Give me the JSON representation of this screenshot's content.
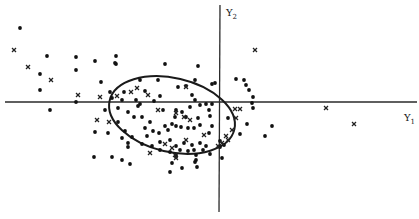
{
  "chart_data": {
    "type": "scatter",
    "title": "",
    "xlabel": "Y1",
    "ylabel": "Y2",
    "axes": {
      "origin_px": [
        220,
        102
      ],
      "x_axis_px": [
        5,
        417
      ],
      "y_axis_px": [
        5,
        212
      ],
      "ticks": "none",
      "grid": false
    },
    "ellipse": {
      "cx": 172,
      "cy": 115,
      "rx": 64,
      "ry": 37,
      "rotate_deg": 13,
      "description": "concentration ellipse around the main cluster"
    },
    "legend": null,
    "series": [
      {
        "name": "dots",
        "marker": "dot",
        "points": [
          [
            20,
            28
          ],
          [
            47,
            56
          ],
          [
            40,
            74
          ],
          [
            76,
            57
          ],
          [
            76,
            70
          ],
          [
            95,
            61
          ],
          [
            116,
            56
          ],
          [
            116,
            64
          ],
          [
            101,
            82
          ],
          [
            40,
            90
          ],
          [
            76,
            102
          ],
          [
            105,
            110
          ],
          [
            95,
            132
          ],
          [
            108,
            133
          ],
          [
            122,
            138
          ],
          [
            128,
            147
          ],
          [
            94,
            157
          ],
          [
            112,
            157
          ],
          [
            115,
            63
          ],
          [
            140,
            80
          ],
          [
            158,
            80
          ],
          [
            160,
            96
          ],
          [
            145,
            91
          ],
          [
            124,
            92
          ],
          [
            110,
            92
          ],
          [
            112,
            98
          ],
          [
            122,
            100
          ],
          [
            136,
            100
          ],
          [
            140,
            104
          ],
          [
            165,
            64
          ],
          [
            198,
            66
          ],
          [
            195,
            80
          ],
          [
            192,
            95
          ],
          [
            195,
            100
          ],
          [
            178,
            87
          ],
          [
            186,
            86
          ],
          [
            154,
            101
          ],
          [
            163,
            110
          ],
          [
            176,
            110
          ],
          [
            138,
            106
          ],
          [
            118,
            108
          ],
          [
            128,
            112
          ],
          [
            118,
            122
          ],
          [
            134,
            117
          ],
          [
            125,
            131
          ],
          [
            132,
            137
          ],
          [
            128,
            143
          ],
          [
            142,
            117
          ],
          [
            150,
            122
          ],
          [
            145,
            128
          ],
          [
            147,
            136
          ],
          [
            153,
            131
          ],
          [
            159,
            133
          ],
          [
            165,
            126
          ],
          [
            172,
            124
          ],
          [
            168,
            130
          ],
          [
            176,
            126
          ],
          [
            181,
            127
          ],
          [
            188,
            128
          ],
          [
            194,
            128
          ],
          [
            200,
            125
          ],
          [
            198,
            118
          ],
          [
            186,
            117
          ],
          [
            175,
            117
          ],
          [
            182,
            112
          ],
          [
            190,
            107
          ],
          [
            200,
            105
          ],
          [
            206,
            104
          ],
          [
            212,
            104
          ],
          [
            209,
            110
          ],
          [
            210,
            116
          ],
          [
            212,
            126
          ],
          [
            209,
            133
          ],
          [
            142,
            144
          ],
          [
            152,
            146
          ],
          [
            160,
            142
          ],
          [
            170,
            140
          ],
          [
            176,
            146
          ],
          [
            184,
            143
          ],
          [
            192,
            145
          ],
          [
            200,
            143
          ],
          [
            206,
            146
          ],
          [
            160,
            150
          ],
          [
            170,
            152
          ],
          [
            180,
            150
          ],
          [
            188,
            151
          ],
          [
            194,
            150
          ],
          [
            196,
            155
          ],
          [
            203,
            150
          ],
          [
            176,
            155
          ],
          [
            195,
            162
          ],
          [
            210,
            154
          ],
          [
            220,
            147
          ],
          [
            122,
            160
          ],
          [
            130,
            164
          ],
          [
            176,
            157
          ],
          [
            172,
            163
          ],
          [
            170,
            172
          ],
          [
            182,
            168
          ],
          [
            196,
            160
          ],
          [
            197,
            167
          ],
          [
            212,
            84
          ],
          [
            215,
            83
          ],
          [
            236,
            79
          ],
          [
            244,
            80
          ],
          [
            246,
            85
          ],
          [
            249,
            90
          ],
          [
            253,
            97
          ],
          [
            252,
            103
          ],
          [
            253,
            108
          ],
          [
            228,
            118
          ],
          [
            247,
            124
          ],
          [
            240,
            134
          ],
          [
            265,
            136
          ],
          [
            272,
            126
          ],
          [
            224,
            145
          ],
          [
            222,
            158
          ],
          [
            50,
            110
          ],
          [
            220,
            141
          ]
        ]
      },
      {
        "name": "crosses",
        "marker": "x",
        "points": [
          [
            14,
            50
          ],
          [
            28,
            67
          ],
          [
            51,
            80
          ],
          [
            78,
            95
          ],
          [
            100,
            97
          ],
          [
            97,
            120
          ],
          [
            109,
            122
          ],
          [
            131,
            92
          ],
          [
            117,
            96
          ],
          [
            148,
            95
          ],
          [
            137,
            88
          ],
          [
            158,
            110
          ],
          [
            186,
            87
          ],
          [
            176,
            113
          ],
          [
            184,
            117
          ],
          [
            190,
            120
          ],
          [
            165,
            144
          ],
          [
            172,
            148
          ],
          [
            186,
            140
          ],
          [
            204,
            135
          ],
          [
            150,
            153
          ],
          [
            175,
            155
          ],
          [
            176,
            158
          ],
          [
            235,
            109
          ],
          [
            240,
            109
          ],
          [
            236,
            118
          ],
          [
            232,
            130
          ],
          [
            226,
            136
          ],
          [
            228,
            140
          ],
          [
            222,
            143
          ],
          [
            218,
            146
          ],
          [
            255,
            50
          ],
          [
            326,
            108
          ],
          [
            354,
            124
          ]
        ]
      }
    ]
  },
  "labels": {
    "y_axis_main": "Y",
    "y_axis_sub": "2",
    "x_axis_main": "Y",
    "x_axis_sub": "1"
  }
}
